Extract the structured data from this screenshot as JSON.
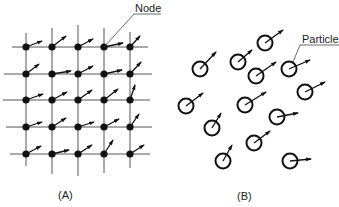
{
  "panel_a": {
    "caption": "(A)",
    "callout": "Node",
    "grid_x": [
      26,
      52,
      78,
      104,
      130
    ],
    "grid_y": [
      47,
      74,
      100,
      127,
      154
    ],
    "hlines": [
      {
        "y": 47,
        "x1": 12,
        "x2": 148
      },
      {
        "y": 74,
        "x1": 4,
        "x2": 152
      },
      {
        "y": 100,
        "x1": 3,
        "x2": 150
      },
      {
        "y": 127,
        "x1": 6,
        "x2": 152
      },
      {
        "y": 154,
        "x1": 10,
        "x2": 150
      }
    ],
    "vlines": [
      {
        "x": 26,
        "y1": 33,
        "y2": 166
      },
      {
        "x": 52,
        "y1": 28,
        "y2": 174
      },
      {
        "x": 78,
        "y1": 25,
        "y2": 176
      },
      {
        "x": 104,
        "y1": 28,
        "y2": 173
      },
      {
        "x": 130,
        "y1": 32,
        "y2": 168
      }
    ],
    "nodes": [
      {
        "x": 26,
        "y": 47,
        "dx": 16,
        "dy": -6
      },
      {
        "x": 52,
        "y": 47,
        "dx": 14,
        "dy": -11
      },
      {
        "x": 78,
        "y": 47,
        "dx": 15,
        "dy": -8
      },
      {
        "x": 104,
        "y": 47,
        "dx": 19,
        "dy": -4
      },
      {
        "x": 130,
        "y": 47,
        "dx": 10,
        "dy": -11
      },
      {
        "x": 26,
        "y": 74,
        "dx": 13,
        "dy": -10
      },
      {
        "x": 52,
        "y": 74,
        "dx": 19,
        "dy": -3
      },
      {
        "x": 78,
        "y": 74,
        "dx": 15,
        "dy": -8
      },
      {
        "x": 104,
        "y": 74,
        "dx": 18,
        "dy": -4
      },
      {
        "x": 130,
        "y": 74,
        "dx": 11,
        "dy": -12
      },
      {
        "x": 26,
        "y": 100,
        "dx": 17,
        "dy": -6
      },
      {
        "x": 52,
        "y": 100,
        "dx": 15,
        "dy": -8
      },
      {
        "x": 78,
        "y": 100,
        "dx": 14,
        "dy": -10
      },
      {
        "x": 104,
        "y": 100,
        "dx": 14,
        "dy": -11
      },
      {
        "x": 130,
        "y": 100,
        "dx": 5,
        "dy": -15
      },
      {
        "x": 26,
        "y": 127,
        "dx": 16,
        "dy": -5
      },
      {
        "x": 52,
        "y": 127,
        "dx": 14,
        "dy": -9
      },
      {
        "x": 78,
        "y": 127,
        "dx": 16,
        "dy": -5
      },
      {
        "x": 104,
        "y": 127,
        "dx": 15,
        "dy": -8
      },
      {
        "x": 130,
        "y": 127,
        "dx": 9,
        "dy": -13
      },
      {
        "x": 26,
        "y": 154,
        "dx": 15,
        "dy": -8
      },
      {
        "x": 52,
        "y": 154,
        "dx": 17,
        "dy": -4
      },
      {
        "x": 78,
        "y": 154,
        "dx": 14,
        "dy": -9
      },
      {
        "x": 104,
        "y": 154,
        "dx": 9,
        "dy": -14
      },
      {
        "x": 130,
        "y": 154,
        "dx": 14,
        "dy": -9
      }
    ]
  },
  "panel_b": {
    "caption": "(B)",
    "callout": "Particle",
    "particles": [
      {
        "x": 265,
        "y": 43,
        "dx": 18,
        "dy": -13
      },
      {
        "x": 200,
        "y": 69,
        "dx": 16,
        "dy": -17
      },
      {
        "x": 238,
        "y": 62,
        "dx": 14,
        "dy": -12
      },
      {
        "x": 256,
        "y": 76,
        "dx": 20,
        "dy": -14
      },
      {
        "x": 289,
        "y": 69,
        "dx": 21,
        "dy": -9
      },
      {
        "x": 305,
        "y": 92,
        "dx": 20,
        "dy": -10
      },
      {
        "x": 186,
        "y": 106,
        "dx": 17,
        "dy": -13
      },
      {
        "x": 245,
        "y": 105,
        "dx": 21,
        "dy": -13
      },
      {
        "x": 277,
        "y": 117,
        "dx": 21,
        "dy": -4
      },
      {
        "x": 212,
        "y": 128,
        "dx": 9,
        "dy": -15
      },
      {
        "x": 254,
        "y": 143,
        "dx": 16,
        "dy": -12
      },
      {
        "x": 223,
        "y": 161,
        "dx": 9,
        "dy": -16
      },
      {
        "x": 290,
        "y": 161,
        "dx": 21,
        "dy": -2
      }
    ]
  }
}
